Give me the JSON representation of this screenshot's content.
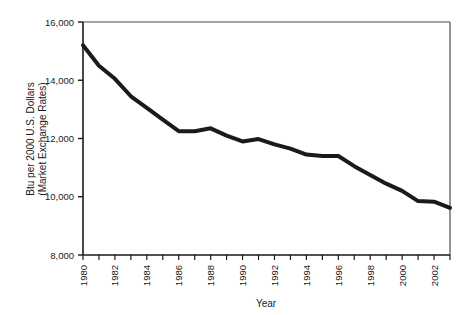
{
  "chart_data": {
    "type": "line",
    "title": "",
    "xlabel": "Year",
    "ylabel": "Btu per 2000 U.S. Dollars (Market Exchange Rates)",
    "ylabel_line1": "Btu per 2000 U.S. Dollars",
    "ylabel_line2": "(Market Exchange Rates)",
    "xlim": [
      1980,
      2003
    ],
    "ylim": [
      8000,
      16000
    ],
    "grid": false,
    "legend": "none",
    "line_color": "#1a1a1a",
    "line_width_px": 4,
    "y_ticks": [
      8000,
      10000,
      12000,
      14000,
      16000
    ],
    "y_tick_labels": [
      "8,000",
      "10,000",
      "12,000",
      "14,000",
      "16,000"
    ],
    "x_ticks": [
      1980,
      1981,
      1982,
      1983,
      1984,
      1985,
      1986,
      1987,
      1988,
      1989,
      1990,
      1991,
      1992,
      1993,
      1994,
      1995,
      1996,
      1997,
      1998,
      1999,
      2000,
      2001,
      2002,
      2003
    ],
    "x_tick_labels_shown": [
      "1980",
      "1982",
      "1984",
      "1986",
      "1988",
      "1990",
      "1992",
      "1994",
      "1996",
      "1998",
      "2000",
      "2002"
    ],
    "x_tick_label_rotation_deg": -90,
    "x": [
      1980,
      1981,
      1982,
      1983,
      1984,
      1985,
      1986,
      1987,
      1988,
      1989,
      1990,
      1991,
      1992,
      1993,
      1994,
      1995,
      1996,
      1997,
      1998,
      1999,
      2000,
      2001,
      2002,
      2003
    ],
    "values": [
      15200,
      14500,
      14050,
      13450,
      13050,
      12650,
      12250,
      12250,
      12350,
      12100,
      11900,
      11980,
      11800,
      11650,
      11450,
      11400,
      11400,
      11050,
      10750,
      10450,
      10200,
      9850,
      9830,
      9620
    ],
    "series": [
      {
        "name": "Energy intensity",
        "values": [
          15200,
          14500,
          14050,
          13450,
          13050,
          12650,
          12250,
          12250,
          12350,
          12100,
          11900,
          11980,
          11800,
          11650,
          11450,
          11400,
          11400,
          11050,
          10750,
          10450,
          10200,
          9850,
          9830,
          9620
        ]
      }
    ]
  },
  "axes": {
    "x_axis_title": "Year",
    "y_axis_title_line1": "Btu per 2000 U.S. Dollars",
    "y_axis_title_line2": "(Market Exchange Rates)"
  }
}
